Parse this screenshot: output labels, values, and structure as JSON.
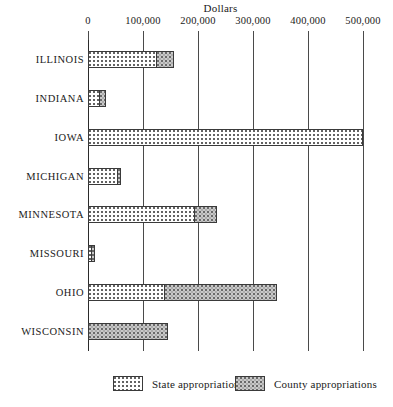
{
  "chart_data": {
    "type": "bar",
    "orientation": "horizontal",
    "stacked": true,
    "title": "",
    "xlabel": "Dollars",
    "ylabel": "",
    "xlim": [
      0,
      500000
    ],
    "grid": true,
    "grid_axis": "x",
    "legend_position": "bottom",
    "axis_title": "Dollars",
    "xticks": [
      0,
      100000,
      200000,
      300000,
      400000,
      500000
    ],
    "xtick_labels": [
      "0",
      "100,000",
      "200,000",
      "300,000",
      "400,000",
      "500,000"
    ],
    "categories": [
      "ILLINOIS",
      "INDIANA",
      "IOWA",
      "MICHIGAN",
      "MINNESOTA",
      "MISSOURI",
      "OHIO",
      "WISCONSIN"
    ],
    "series": [
      {
        "name": "State appropriations",
        "values": [
          126000,
          22000,
          500000,
          55000,
          195000,
          8000,
          140000,
          0
        ]
      },
      {
        "name": "County appropriations",
        "values": [
          33000,
          13000,
          0,
          7000,
          42000,
          7000,
          206000,
          145000
        ]
      }
    ],
    "legend": [
      {
        "label": "State appropriations",
        "pattern": "dotted-white"
      },
      {
        "label": "County appropriations",
        "pattern": "stippled-gray"
      }
    ],
    "colors": {
      "state_fill": "#ffffff",
      "state_dot": "#5d5d5d",
      "county_fill": "#c9c9c9",
      "county_dot": "#6a6a6a",
      "outline": "#3a3a3a",
      "gridline": "#4a4a4a",
      "axis": "#2b2b2b",
      "text": "#1a1a1a"
    }
  }
}
